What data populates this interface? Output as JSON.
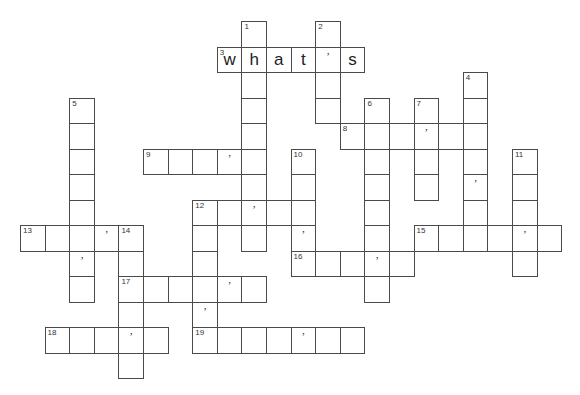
{
  "puzzle": {
    "type": "crossword",
    "grid_geometry": {
      "origin_x": 20,
      "origin_y": 21,
      "cell_w": 24.6,
      "cell_h": 25.5
    },
    "entries": [
      {
        "number": "1",
        "direction": "down",
        "row": 0,
        "col": 9,
        "length": 9,
        "apostrophes": [],
        "letters": {}
      },
      {
        "number": "2",
        "direction": "down",
        "row": 0,
        "col": 12,
        "length": 4,
        "apostrophes": [],
        "letters": {}
      },
      {
        "number": "3",
        "direction": "across",
        "row": 1,
        "col": 8,
        "length": 6,
        "apostrophes": [
          4
        ],
        "letters": {
          "0": "w",
          "1": "h",
          "2": "a",
          "3": "t",
          "5": "s"
        }
      },
      {
        "number": "4",
        "direction": "down",
        "row": 2,
        "col": 18,
        "length": 7,
        "apostrophes": [
          4
        ],
        "letters": {}
      },
      {
        "number": "5",
        "direction": "down",
        "row": 3,
        "col": 2,
        "length": 8,
        "apostrophes": [
          6
        ],
        "letters": {}
      },
      {
        "number": "6",
        "direction": "down",
        "row": 3,
        "col": 14,
        "length": 8,
        "apostrophes": [
          6
        ],
        "letters": {}
      },
      {
        "number": "7",
        "direction": "down",
        "row": 3,
        "col": 16,
        "length": 4,
        "apostrophes": [
          1
        ],
        "letters": {}
      },
      {
        "number": "8",
        "direction": "across",
        "row": 4,
        "col": 13,
        "length": 6,
        "apostrophes": [
          3
        ],
        "letters": {}
      },
      {
        "number": "9",
        "direction": "across",
        "row": 5,
        "col": 5,
        "length": 5,
        "apostrophes": [
          3
        ],
        "letters": {}
      },
      {
        "number": "10",
        "direction": "down",
        "row": 5,
        "col": 11,
        "length": 5,
        "apostrophes": [
          3
        ],
        "letters": {}
      },
      {
        "number": "11",
        "direction": "down",
        "row": 5,
        "col": 20,
        "length": 5,
        "apostrophes": [
          3
        ],
        "letters": {}
      },
      {
        "number": "12",
        "direction": "across",
        "row": 7,
        "col": 7,
        "length": 5,
        "apostrophes": [
          2
        ],
        "letters": {}
      },
      {
        "number": "12",
        "direction": "down",
        "row": 7,
        "col": 7,
        "length": 6,
        "apostrophes": [
          4
        ],
        "letters": {}
      },
      {
        "number": "13",
        "direction": "across",
        "row": 8,
        "col": 0,
        "length": 5,
        "apostrophes": [
          3
        ],
        "letters": {}
      },
      {
        "number": "14",
        "direction": "down",
        "row": 8,
        "col": 4,
        "length": 6,
        "apostrophes": [],
        "letters": {}
      },
      {
        "number": "15",
        "direction": "across",
        "row": 8,
        "col": 16,
        "length": 6,
        "apostrophes": [
          4
        ],
        "letters": {}
      },
      {
        "number": "16",
        "direction": "across",
        "row": 9,
        "col": 11,
        "length": 5,
        "apostrophes": [
          3
        ],
        "letters": {}
      },
      {
        "number": "17",
        "direction": "across",
        "row": 10,
        "col": 4,
        "length": 6,
        "apostrophes": [
          4
        ],
        "letters": {}
      },
      {
        "number": "18",
        "direction": "across",
        "row": 12,
        "col": 1,
        "length": 5,
        "apostrophes": [
          3
        ],
        "letters": {}
      },
      {
        "number": "19",
        "direction": "across",
        "row": 12,
        "col": 7,
        "length": 7,
        "apostrophes": [
          4
        ],
        "letters": {}
      }
    ],
    "apostrophe_glyph": "’",
    "colors": {
      "border": "#4a4a4a",
      "background": "#ffffff",
      "text": "#222222"
    }
  }
}
